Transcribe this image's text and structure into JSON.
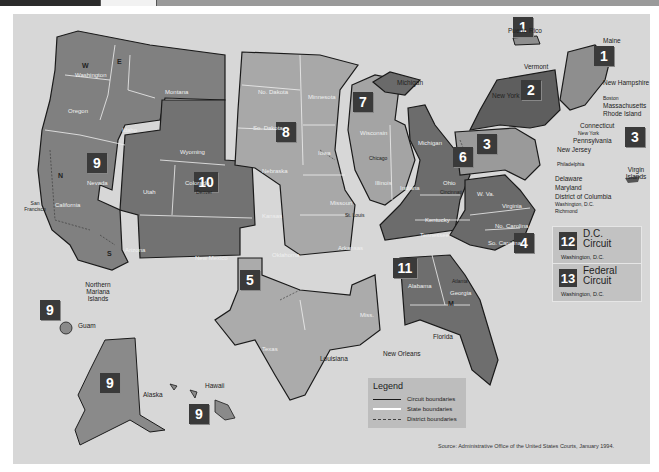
{
  "header": {
    "bar": "dark-strip"
  },
  "map": {
    "title": "U.S. Federal Judicial Circuits",
    "circuits": [
      {
        "number": "1",
        "states": [
          "Maine",
          "New Hampshire",
          "Massachusetts",
          "Rhode Island",
          "Puerto Rico"
        ]
      },
      {
        "number": "2",
        "states": [
          "Vermont",
          "New York",
          "Connecticut"
        ]
      },
      {
        "number": "3",
        "states": [
          "Pennsylvania",
          "New Jersey",
          "Delaware",
          "Virgin Islands"
        ]
      },
      {
        "number": "4",
        "states": [
          "Maryland",
          "W. Va.",
          "Virginia",
          "No. Carolina",
          "So. Carolina"
        ]
      },
      {
        "number": "5",
        "states": [
          "Texas",
          "Louisiana",
          "Miss."
        ]
      },
      {
        "number": "6",
        "states": [
          "Michigan",
          "Ohio",
          "Kentucky",
          "Tennessee"
        ]
      },
      {
        "number": "7",
        "states": [
          "Wisconsin",
          "Illinois",
          "Indiana"
        ]
      },
      {
        "number": "8",
        "states": [
          "No. Dakota",
          "Minnesota",
          "So. Dakota",
          "Nebraska",
          "Iowa",
          "Missouri",
          "Arkansas"
        ]
      },
      {
        "number": "9",
        "states": [
          "Washington",
          "Oregon",
          "Montana",
          "Idaho",
          "Nevada",
          "California",
          "Arizona",
          "Alaska",
          "Hawaii",
          "Guam",
          "Northern Mariana Islands"
        ]
      },
      {
        "number": "10",
        "states": [
          "Wyoming",
          "Utah",
          "Colorado",
          "Kansas",
          "New Mexico",
          "Oklahoma"
        ]
      },
      {
        "number": "11",
        "states": [
          "Alabama",
          "Georgia",
          "Florida"
        ]
      }
    ],
    "badges": {
      "c1a": "1",
      "c1b": "1",
      "c2": "2",
      "c3a": "3",
      "c3b": "3",
      "c4": "4",
      "c5": "5",
      "c6": "6",
      "c7": "7",
      "c8": "8",
      "c9a": "9",
      "c9b": "9",
      "c9c": "9",
      "c9d": "9",
      "c10": "10",
      "c11": "11"
    },
    "state_labels": {
      "washington": "Washington",
      "oregon": "Oregon",
      "montana": "Montana",
      "idaho": "Idaho",
      "nevada": "Nevada",
      "california": "California",
      "arizona": "Arizona",
      "wyoming": "Wyoming",
      "utah": "Utah",
      "colorado": "Colorado",
      "new_mexico": "New Mexico",
      "kansas": "Kansas",
      "oklahoma": "Oklahoma",
      "no_dakota": "No. Dakota",
      "so_dakota": "So. Dakota",
      "nebraska": "Nebraska",
      "minnesota": "Minnesota",
      "iowa": "Iowa",
      "missouri": "Missouri",
      "arkansas": "Arkansas",
      "wisconsin": "Wisconsin",
      "illinois": "Illinois",
      "indiana": "Indiana",
      "michigan_lp": "Michigan",
      "ohio": "Ohio",
      "kentucky": "Kentucky",
      "tennessee": "Tennessee",
      "wva": "W. Va.",
      "virginia": "Virginia",
      "no_carolina": "No. Carolina",
      "so_carolina": "So. Carolina",
      "alabama": "Alabama",
      "georgia": "Georgia",
      "texas": "Texas",
      "miss": "Miss."
    },
    "callouts": {
      "puerto_rico": "Puerto Rico",
      "maine": "Maine",
      "vermont": "Vermont",
      "new_york": "New York",
      "new_hampshire": "New Hampshire",
      "boston": "Boston",
      "massachusetts": "Massachusetts",
      "rhode_island": "Rhode Island",
      "connecticut": "Connecticut",
      "new_york_city": "New York",
      "pennsylvania": "Pennsylvania",
      "new_jersey": "New Jersey",
      "philadelphia": "Philadelphia",
      "virgin_islands": "Virgin Islands",
      "delaware": "Delaware",
      "maryland": "Maryland",
      "dc": "District of Columbia",
      "washington_dc": "Washington, D.C.",
      "richmond": "Richmond",
      "michigan_up": "Michigan",
      "chicago": "Chicago",
      "st_louis": "St. Louis",
      "denver": "Denver",
      "san_francisco": "San Francisco",
      "northern_mariana": "Northern Mariana Islands",
      "guam": "Guam",
      "alaska": "Alaska",
      "hawaii": "Hawaii",
      "louisiana": "Louisiana",
      "new_orleans": "New Orleans",
      "florida": "Florida",
      "atlanta": "Atlanta",
      "cincinnati": "Cincinnati"
    },
    "special_circuits": [
      {
        "number": "12",
        "name_line1": "D.C.",
        "name_line2": "Circuit",
        "location": "Washington, D.C."
      },
      {
        "number": "13",
        "name_line1": "Federal",
        "name_line2": "Circuit",
        "location": "Washington, D.C."
      }
    ],
    "district_letters": [
      "W",
      "E",
      "N",
      "S",
      "M"
    ]
  },
  "legend": {
    "title": "Legend",
    "items": [
      {
        "label": "Circuit boundaries",
        "style": "solid-dark",
        "color": "#1a1a1a"
      },
      {
        "label": "State boundaries",
        "style": "solid-white",
        "color": "#ffffff"
      },
      {
        "label": "District boundaries",
        "style": "dashed",
        "color": "#444444"
      }
    ]
  },
  "source": "Source: Administrative Office of the United States Courts, January 1994.",
  "colors": {
    "background": "#d7d7d7",
    "circuit_dark": "#6e6e6e",
    "circuit_mid": "#8a8a8a",
    "circuit_light": "#b0b0b0",
    "badge": "#3a3a3a"
  }
}
